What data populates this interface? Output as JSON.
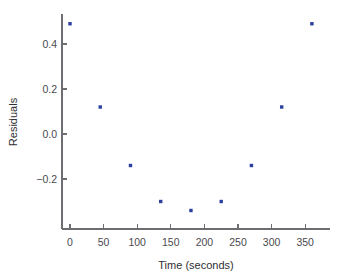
{
  "chart_data": {
    "type": "scatter",
    "title": "",
    "xlabel": "Time (seconds)",
    "ylabel": "Residuals",
    "x": [
      0,
      45,
      90,
      135,
      180,
      225,
      270,
      315,
      360
    ],
    "values": [
      0.49,
      0.12,
      -0.14,
      -0.3,
      -0.34,
      -0.3,
      -0.14,
      0.12,
      0.49
    ],
    "series": [
      {
        "name": "Residuals",
        "points": [
          {
            "x": 0,
            "y": 0.49
          },
          {
            "x": 45,
            "y": 0.12
          },
          {
            "x": 90,
            "y": -0.14
          },
          {
            "x": 135,
            "y": -0.3
          },
          {
            "x": 180,
            "y": -0.34
          },
          {
            "x": 225,
            "y": -0.3
          },
          {
            "x": 270,
            "y": -0.14
          },
          {
            "x": 315,
            "y": 0.12
          },
          {
            "x": 360,
            "y": 0.49
          }
        ]
      }
    ],
    "xticks": [
      0,
      50,
      100,
      150,
      200,
      250,
      300,
      350
    ],
    "xticklabels": [
      "0",
      "50",
      "100",
      "150",
      "200",
      "250",
      "300",
      "350"
    ],
    "yticks": [
      0.4,
      0.2,
      0.0,
      -0.2
    ],
    "yticklabels": [
      "0.4",
      "0.2",
      "0.0",
      "−0.2"
    ],
    "xlim": [
      -12,
      390
    ],
    "ylim": [
      -0.42,
      0.56
    ],
    "grid": false,
    "legend": "none",
    "marker_color": "#2b3f9e",
    "axis_color": "#6e6e72"
  },
  "axes": {
    "x_title": "Time (seconds)",
    "y_title": "Residuals"
  }
}
